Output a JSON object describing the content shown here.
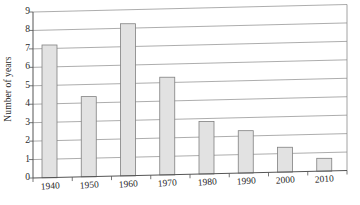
{
  "chart_data": {
    "type": "bar",
    "title": "",
    "subtitle": "",
    "xlabel": "",
    "ylabel": "Number of years",
    "categories": [
      "1940",
      "1950",
      "1960",
      "1970",
      "1980",
      "1990",
      "2000",
      "2010"
    ],
    "values": [
      7.2,
      4.35,
      8.25,
      5.3,
      2.85,
      2.3,
      1.35,
      0.7
    ],
    "series": [
      {
        "name": "Number of years",
        "values": [
          7.2,
          4.35,
          8.25,
          5.3,
          2.85,
          2.3,
          1.35,
          0.7
        ]
      }
    ],
    "ylim": [
      0,
      9
    ],
    "ytick_labels": [
      "0",
      "1",
      "2",
      "3",
      "4",
      "5",
      "6",
      "7",
      "8",
      "9"
    ],
    "ytick_values": [
      0,
      1,
      2,
      3,
      4,
      5,
      6,
      7,
      8,
      9
    ],
    "xtick_labels": [
      "1940",
      "1950",
      "1960",
      "1970",
      "1980",
      "1990",
      "2000",
      "2010"
    ],
    "grid": "horizontal",
    "legend": "none",
    "legend_position": "",
    "annotations": [],
    "bar_fill_color": "#e2e2e2",
    "bar_border_color": "#808080",
    "grid_color": "#8a8a8a",
    "axis_color": "#555555",
    "text_color": "#2b2b2b"
  }
}
